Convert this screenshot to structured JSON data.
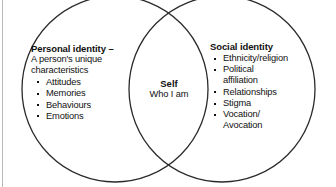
{
  "diagram": {
    "type": "venn",
    "colors": {
      "stroke": "#2b2b2b",
      "text": "#111111",
      "background": "#ffffff",
      "edge_rule": "#b9b9b9"
    },
    "left_circle": {
      "heading": "Personal identity –",
      "subtitle_line1": "A person's unique",
      "subtitle_line2": "characteristics",
      "items": [
        "Attitudes",
        "Memories",
        "Behaviours",
        "Emotions"
      ]
    },
    "overlap": {
      "title": "Self",
      "subtitle": "Who I am"
    },
    "right_circle": {
      "heading": "Social identity",
      "items": [
        {
          "line1": "Ethnicity/religion",
          "line2": ""
        },
        {
          "line1": "Political",
          "line2": "affiliation"
        },
        {
          "line1": "Relationships",
          "line2": ""
        },
        {
          "line1": "Stigma",
          "line2": ""
        },
        {
          "line1": "Vocation/",
          "line2": "Avocation"
        }
      ]
    }
  }
}
